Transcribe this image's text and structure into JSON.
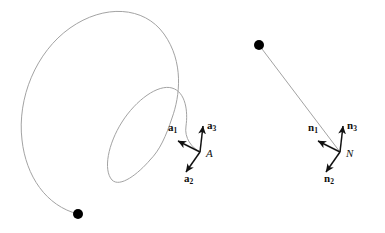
{
  "figure": {
    "background_color": "#ffffff",
    "curve_color": "#a3a3a3",
    "arrow_color": "#111111",
    "marker_color": "#000000",
    "width": 385,
    "height": 233
  },
  "left_object": {
    "name": "spiral-trajectory",
    "start_marker": {
      "x": 78,
      "y": 214,
      "radius": 5
    },
    "end_point": {
      "x": 200,
      "y": 152
    },
    "triad": {
      "origin_label": "A",
      "origin": {
        "x": 200,
        "y": 152
      },
      "origin_label_pos": {
        "x": 206,
        "y": 148
      },
      "vectors": [
        {
          "label": "a",
          "subscript": "1",
          "tip": {
            "x": 178,
            "y": 141
          },
          "label_pos": {
            "x": 168,
            "y": 122
          }
        },
        {
          "label": "a",
          "subscript": "3",
          "tip": {
            "x": 203,
            "y": 126
          },
          "label_pos": {
            "x": 207,
            "y": 120
          }
        },
        {
          "label": "a",
          "subscript": "2",
          "tip": {
            "x": 186,
            "y": 172
          },
          "label_pos": {
            "x": 184,
            "y": 173
          }
        }
      ]
    }
  },
  "right_object": {
    "name": "straight-trajectory",
    "start_marker": {
      "x": 259,
      "y": 45,
      "radius": 5
    },
    "end_point": {
      "x": 340,
      "y": 152
    },
    "triad": {
      "origin_label": "N",
      "origin": {
        "x": 340,
        "y": 152
      },
      "origin_label_pos": {
        "x": 346,
        "y": 148
      },
      "vectors": [
        {
          "label": "n",
          "subscript": "1",
          "tip": {
            "x": 318,
            "y": 141
          },
          "label_pos": {
            "x": 308,
            "y": 122
          }
        },
        {
          "label": "n",
          "subscript": "3",
          "tip": {
            "x": 343,
            "y": 126
          },
          "label_pos": {
            "x": 347,
            "y": 120
          }
        },
        {
          "label": "n",
          "subscript": "2",
          "tip": {
            "x": 326,
            "y": 172
          },
          "label_pos": {
            "x": 324,
            "y": 173
          }
        }
      ]
    }
  }
}
